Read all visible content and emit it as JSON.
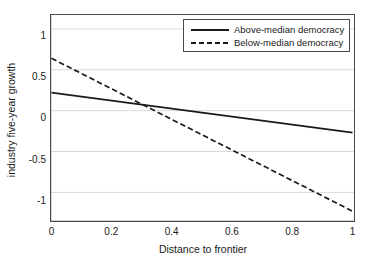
{
  "chart_data": {
    "type": "line",
    "title": "",
    "xlabel": "Distance to frontier",
    "ylabel": "industry five-year growth",
    "xlim": [
      0,
      1
    ],
    "ylim": [
      -1.35,
      1.17
    ],
    "xticks": [
      "0",
      "0.2",
      "0.4",
      "0.6",
      "0.8",
      "1"
    ],
    "xtick_values": [
      0,
      0.2,
      0.4,
      0.6,
      0.8,
      1
    ],
    "yticks": [
      "1",
      "0.5",
      "0",
      "-0.5",
      "-1"
    ],
    "ytick_values": [
      1,
      0.5,
      0,
      -0.5,
      -1
    ],
    "grid": "horizontal",
    "grid_color": "#d9d9d9",
    "legend_position": "top-right",
    "series": [
      {
        "name": "Above-median democracy",
        "style": "solid",
        "color": "#1a1a1a",
        "x": [
          0,
          1
        ],
        "values": [
          0.22,
          -0.27
        ]
      },
      {
        "name": "Below-median democracy",
        "style": "dashed",
        "color": "#1a1a1a",
        "x": [
          0,
          1
        ],
        "values": [
          0.64,
          -1.23
        ]
      }
    ],
    "annotations": {
      "crossing_point": {
        "x": 0.3,
        "y": 0.05
      }
    }
  },
  "legend": {
    "items": [
      {
        "label": "Above-median democracy",
        "key": "solid-line-key"
      },
      {
        "label": "Below-median democracy",
        "key": "dashed-line-key"
      }
    ]
  }
}
